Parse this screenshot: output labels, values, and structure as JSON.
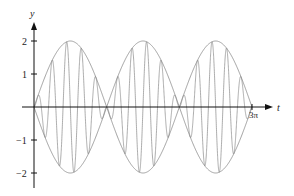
{
  "chart_data": {
    "type": "line",
    "title": "",
    "xlabel": "t",
    "ylabel": "y",
    "xlim": [
      0,
      9.42477796
    ],
    "ylim": [
      -2.5,
      2.5
    ],
    "grid": false,
    "legend": null,
    "x_tick_labels": [
      {
        "value": 9.42477796,
        "label": "3π"
      }
    ],
    "y_tick_labels": [
      {
        "value": 2,
        "label": "2"
      },
      {
        "value": 1,
        "label": "1"
      },
      {
        "value": -1,
        "label": "−1"
      },
      {
        "value": -2,
        "label": "−2"
      }
    ],
    "series": [
      {
        "name": "signal",
        "expression": "2 sin(t) sin(10t)",
        "amplitude": 2,
        "envelope_freq": 1,
        "carrier_freq": 10
      },
      {
        "name": "upper envelope",
        "expression": "2|sin(t)|"
      },
      {
        "name": "lower envelope",
        "expression": "-2|sin(t)|"
      }
    ],
    "annotations": []
  },
  "colors": {
    "axis": "#111111",
    "curve": "#888888",
    "envelope": "#888888"
  },
  "layout": {
    "origin_x": 34,
    "origin_y": 107,
    "px_per_unit_y": 33,
    "x_end_px": 252,
    "axis_right": 273,
    "axis_top": 22,
    "axis_bottom": 188
  }
}
